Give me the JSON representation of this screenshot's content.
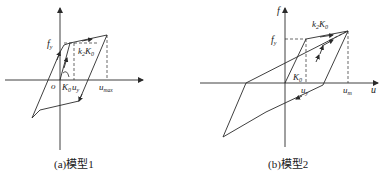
{
  "diagrams": [
    {
      "id": "model1",
      "caption": "(a)模型1",
      "labels": {
        "fy": "f",
        "fy_sub": "y",
        "origin": "o",
        "K0": "K",
        "K0_sub": "0",
        "uy": "u",
        "uy_sub": "y",
        "umax": "u",
        "umax_sub": "max",
        "k2K0_k": "k",
        "k2K0_k_sub": "2",
        "k2K0_K": "K",
        "k2K0_K_sub": "0"
      }
    },
    {
      "id": "model2",
      "caption": "(b)模型2",
      "labels": {
        "f_axis": "f",
        "u_axis": "u",
        "fy": "f",
        "fy_sub": "y",
        "K0": "K",
        "K0_sub": "0",
        "uy": "u",
        "uy_sub": "y",
        "um": "u",
        "um_sub": "m",
        "k2K0_k": "k",
        "k2K0_k_sub": "2",
        "k2K0_K": "K",
        "k2K0_K_sub": "0"
      }
    }
  ],
  "colors": {
    "line": "#2a2a2a",
    "background": "#ffffff"
  }
}
